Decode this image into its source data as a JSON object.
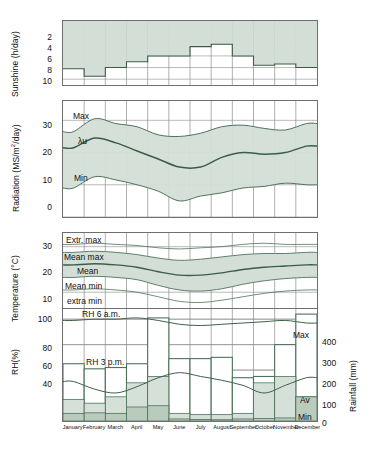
{
  "figure": {
    "months": [
      "January",
      "February",
      "March",
      "April",
      "May",
      "June",
      "July",
      "August",
      "September",
      "October",
      "November",
      "December"
    ],
    "colors": {
      "band_fill": "#d3dfd6",
      "band_fill_dark": "#b8cbbd",
      "line": "#4c7059",
      "line_dark": "#3d5c48",
      "axis": "#6f6f6f",
      "grid": "#8a8a8a",
      "text": "#111111"
    }
  },
  "panels": {
    "sunshine": {
      "axis_title": "Sunshine (h/day)",
      "ticks": [
        "2",
        "4",
        "6",
        "8",
        "10"
      ],
      "ylim": [
        0,
        11
      ],
      "inverted": true
    },
    "radiation": {
      "axis_title_pre": "Radiation (MS/m",
      "axis_title_sup": "2",
      "axis_title_post": "/day)",
      "axis_title_full": "Radiation (MS/m2/day)",
      "ticks": [
        "30",
        "20",
        "10",
        "0"
      ],
      "ylim": [
        0,
        36
      ],
      "labels": {
        "max": "Max",
        "mean": "λu",
        "min": "Min"
      }
    },
    "temperature": {
      "axis_title": "Temperature (°C)",
      "ticks": [
        "30",
        "20",
        "10"
      ],
      "ylim": [
        0,
        36
      ],
      "labels": {
        "extr_max": "Extr. max",
        "mean_max": "Mean max",
        "mean": "Mean",
        "mean_min": "Mean min",
        "extra_min": "extra min"
      }
    },
    "humidity": {
      "axis_title": "RH(%)",
      "ticks": [
        "100",
        "80",
        "60",
        "40"
      ],
      "ylim": [
        20,
        108
      ],
      "labels": {
        "rh6am": "RH 6 a.m.",
        "rh3pm": "RH 3 p.m."
      }
    },
    "rainfall": {
      "axis_title": "Rainfall (mm)",
      "ticks": [
        "400",
        "300",
        "200",
        "100",
        "0"
      ],
      "ylim": [
        0,
        440
      ],
      "labels": {
        "max": "Max",
        "av": "Av",
        "min": "Min"
      }
    }
  },
  "chart_data": [
    {
      "type": "bar",
      "title": "Sunshine (h/day)",
      "xlabel": "",
      "ylabel": "Sunshine (h/day)",
      "ylim": [
        0,
        11
      ],
      "inverted_axis": true,
      "categories": [
        "January",
        "February",
        "March",
        "April",
        "May",
        "June",
        "July",
        "August",
        "September",
        "October",
        "November",
        "December"
      ],
      "values": [
        8.2,
        9.5,
        8.0,
        7.0,
        6.0,
        6.0,
        4.4,
        4.0,
        6.0,
        7.6,
        7.4,
        8.0
      ],
      "grid": true,
      "legend": ""
    },
    {
      "type": "area",
      "title": "Radiation (MS/m2/day)",
      "xlabel": "",
      "ylabel": "Radiation (MS/m2/day)",
      "ylim": [
        0,
        36
      ],
      "categories": [
        "January",
        "February",
        "March",
        "April",
        "May",
        "June",
        "July",
        "August",
        "September",
        "October",
        "November",
        "December"
      ],
      "series": [
        {
          "name": "Max",
          "values": [
            26.5,
            30.5,
            29.0,
            28.0,
            25.5,
            25.0,
            26.0,
            28.0,
            28.5,
            27.5,
            27.0,
            29.0
          ]
        },
        {
          "name": "λu",
          "values": [
            21.5,
            24.5,
            23.0,
            20.5,
            18.0,
            15.5,
            15.5,
            18.5,
            20.0,
            19.5,
            20.0,
            22.0
          ]
        },
        {
          "name": "Min",
          "values": [
            9.0,
            12.5,
            11.5,
            10.0,
            8.0,
            5.0,
            6.5,
            7.5,
            9.0,
            9.5,
            10.5,
            10.0
          ]
        }
      ],
      "grid": true,
      "legend": "inline"
    },
    {
      "type": "line",
      "title": "Temperature (°C)",
      "xlabel": "",
      "ylabel": "Temperature (°C)",
      "ylim": [
        0,
        36
      ],
      "categories": [
        "January",
        "February",
        "March",
        "April",
        "May",
        "June",
        "July",
        "August",
        "September",
        "October",
        "November",
        "December"
      ],
      "series": [
        {
          "name": "Extr. max",
          "values": [
            31.0,
            31.5,
            31.0,
            30.5,
            29.5,
            29.0,
            29.5,
            30.0,
            31.0,
            31.5,
            31.0,
            31.0
          ]
        },
        {
          "name": "Mean max",
          "values": [
            27.5,
            28.0,
            27.5,
            26.5,
            25.0,
            24.0,
            24.5,
            25.5,
            26.5,
            27.0,
            27.0,
            27.5
          ]
        },
        {
          "name": "Mean",
          "values": [
            22.0,
            22.5,
            22.0,
            21.0,
            19.0,
            17.5,
            17.5,
            18.5,
            20.0,
            21.0,
            21.5,
            22.0
          ]
        },
        {
          "name": "Mean min",
          "values": [
            16.5,
            17.0,
            16.5,
            15.5,
            13.0,
            11.0,
            10.5,
            11.5,
            13.5,
            15.0,
            16.0,
            16.5
          ]
        },
        {
          "name": "extra min",
          "values": [
            11.0,
            11.5,
            11.0,
            10.0,
            8.0,
            6.0,
            5.5,
            6.5,
            8.0,
            9.5,
            10.5,
            11.0
          ]
        }
      ],
      "grid": true,
      "legend": "inline"
    },
    {
      "type": "line",
      "title": "RH(%)",
      "xlabel": "",
      "ylabel": "RH(%)",
      "ylim": [
        20,
        108
      ],
      "categories": [
        "January",
        "February",
        "March",
        "April",
        "May",
        "June",
        "July",
        "August",
        "September",
        "October",
        "November",
        "December"
      ],
      "series": [
        {
          "name": "RH 6 a.m.",
          "values": [
            99,
            100,
            100,
            101,
            99,
            96,
            95,
            96,
            97,
            98,
            99,
            97
          ]
        },
        {
          "name": "RH 3 p.m.",
          "values": [
            51,
            45,
            42,
            47,
            54,
            58,
            55,
            52,
            48,
            42,
            48,
            54
          ]
        }
      ],
      "grid": true,
      "legend": "inline"
    },
    {
      "type": "bar",
      "title": "Rainfall (mm)",
      "xlabel": "",
      "ylabel": "Rainfall (mm)",
      "ylim": [
        0,
        440
      ],
      "categories": [
        "January",
        "February",
        "March",
        "April",
        "May",
        "June",
        "July",
        "August",
        "September",
        "October",
        "November",
        "December"
      ],
      "series": [
        {
          "name": "Max",
          "values": [
            225,
            205,
            210,
            225,
            405,
            245,
            245,
            250,
            170,
            175,
            300,
            420
          ]
        },
        {
          "name": "Av",
          "values": [
            85,
            70,
            95,
            150,
            175,
            30,
            25,
            25,
            30,
            150,
            175,
            95
          ]
        },
        {
          "name": "Min",
          "values": [
            30,
            32,
            30,
            55,
            60,
            8,
            6,
            5,
            8,
            10,
            12,
            95
          ]
        }
      ],
      "grid": true,
      "legend": "inline"
    }
  ]
}
